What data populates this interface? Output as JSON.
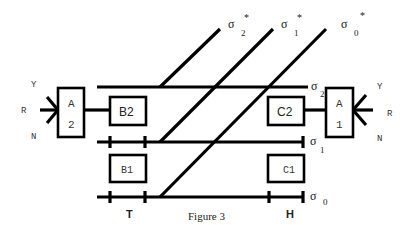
{
  "figure": {
    "caption": "Figure 3",
    "colors": {
      "line": "#000000",
      "background": "#ffffff",
      "text": "#222222"
    }
  },
  "rails": [
    {
      "id": "sigma2",
      "symbol": "σ",
      "subscript": "2"
    },
    {
      "id": "sigma1",
      "symbol": "σ",
      "subscript": "1"
    },
    {
      "id": "sigma0",
      "symbol": "σ",
      "subscript": "0"
    }
  ],
  "diagonals": [
    {
      "id": "sigma2_star",
      "symbol": "σ",
      "subscript": "2",
      "superscript": "*"
    },
    {
      "id": "sigma1_star",
      "symbol": "σ",
      "subscript": "1",
      "superscript": "*"
    },
    {
      "id": "sigma0_star",
      "symbol": "σ",
      "subscript": "0",
      "superscript": "*"
    }
  ],
  "boxes": {
    "a2": {
      "top": "A",
      "bottom": "2"
    },
    "a1": {
      "top": "A",
      "bottom": "1"
    },
    "b2": {
      "label": "B2"
    },
    "b1": {
      "label": "B1"
    },
    "c2": {
      "label": "C2"
    },
    "c1": {
      "label": "C1"
    }
  },
  "signals_left": {
    "y": "Y",
    "r": "R",
    "n": "N"
  },
  "signals_right": {
    "y": "Y",
    "r": "R",
    "n": "N"
  },
  "zones": {
    "left": "T",
    "right": "H"
  }
}
